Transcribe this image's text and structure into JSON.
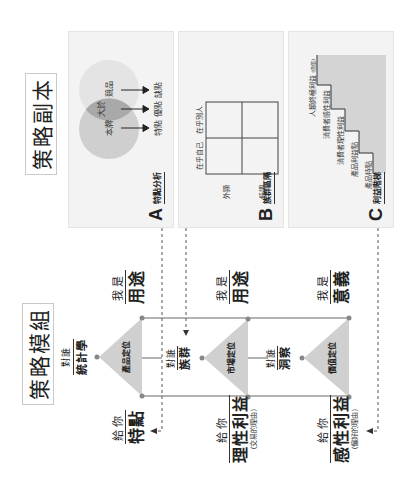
{
  "strategy_copy": {
    "title": "策略副本",
    "panels": [
      {
        "letter": "A",
        "name": "特點分析",
        "venn": {
          "left_circle": "本牌",
          "overlap": "大於",
          "right_circle": "競品",
          "outputs": [
            "特點",
            "優點",
            "缺點"
          ]
        }
      },
      {
        "letter": "B",
        "name": "族群區隔",
        "matrix": {
          "axis_top": [
            "在乎自己",
            "在乎別人"
          ],
          "axis_side": [
            "外顯",
            "低調"
          ]
        }
      },
      {
        "letter": "C",
        "name": "利益階梯",
        "steps": [
          {
            "label": "產品特點"
          },
          {
            "label": "產品利益點"
          },
          {
            "label": "消費者理性利益"
          },
          {
            "label": "消費者感性利益"
          },
          {
            "label": "人類終極利益",
            "note": "(價值)"
          }
        ]
      }
    ]
  },
  "strategy_module": {
    "title": "策略模組",
    "stages": [
      {
        "triangle_label": "產品定位",
        "target_top": "對誰",
        "target_main": "統計學",
        "i_am_top": "我是",
        "i_am_main": "用途",
        "give_top": "給你",
        "give_main": "特點",
        "give_sub": ""
      },
      {
        "triangle_label": "市場定位",
        "target_top": "對誰",
        "target_main": "族群",
        "i_am_top": "我是",
        "i_am_main": "用途",
        "give_top": "給你",
        "give_main": "理性利益",
        "give_sub": "(交易的理由)"
      },
      {
        "triangle_label": "價值定位",
        "target_top": "對誰",
        "target_main": "洞察",
        "i_am_top": "我是",
        "i_am_main": "意義",
        "give_top": "給你",
        "give_main": "感性利益",
        "give_sub": "(偏好的理由)"
      }
    ]
  },
  "colors": {
    "panel_bg": "#f3f3f3",
    "circle_left": "#cfcfcf",
    "circle_right": "#e3e3e3",
    "overlap": "#a9a9a9",
    "triangle": "#cfcfcf",
    "line": "#555555",
    "dot": "#888888"
  }
}
